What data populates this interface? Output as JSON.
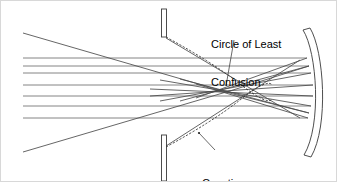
{
  "figure": {
    "background_color": "#ffffff",
    "width": 337,
    "height": 182,
    "ray_color": "#555555",
    "caustic_color": "#2b2b2b",
    "outline_color": "#3a3a3a",
    "label_color": "#000000"
  },
  "labels": {
    "circle_of_least_confusion": {
      "line1": "Circle of Least",
      "line2": "Confusion"
    },
    "caustic": "Caustic"
  },
  "optics": {
    "axis_y": 92,
    "mirror": {
      "name": "concave-mirror",
      "vertex_x": 308,
      "edge_top_y": 30,
      "edge_bottom_y": 155,
      "thickness": 7,
      "curvature": "concave-left"
    },
    "aperture_stop": {
      "name": "aperture-stop",
      "x": 163,
      "bar_width": 5,
      "top_bar": {
        "y_start": 9,
        "y_end": 37
      },
      "bottom_bar": {
        "y_start": 135,
        "y_end": 181
      }
    },
    "incoming_rays": {
      "count": 7,
      "start_x": 23,
      "heights": [
        58,
        66,
        73,
        85,
        96,
        106,
        118
      ]
    },
    "marginal_rays": {
      "count": 2,
      "top_start": {
        "x": 23,
        "y": 33
      },
      "bottom_start": {
        "x": 23,
        "y": 152
      }
    },
    "crossing_region": {
      "name": "circle-of-least-confusion",
      "center_x": 225,
      "center_y": 92
    },
    "caustic_upper": {
      "from_x": 166,
      "from_y": 38,
      "to_x": 268,
      "to_y": 90
    },
    "caustic_lower": {
      "from_x": 166,
      "from_y": 146,
      "to_x": 268,
      "to_y": 95
    }
  },
  "leader_lines": {
    "circle_of_least_confusion": {
      "from_x": 234,
      "from_y": 40,
      "to_x": 226,
      "to_y": 86
    },
    "caustic": {
      "from_x": 215,
      "from_y": 150,
      "to_x": 199,
      "to_y": 133
    }
  }
}
